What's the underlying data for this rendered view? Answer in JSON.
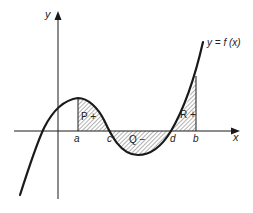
{
  "diagram": {
    "axes": {
      "x_label": "x",
      "y_label": "y"
    },
    "curve_label": "y = f (x)",
    "points": {
      "a": "a",
      "b": "b",
      "c": "c",
      "d": "d"
    },
    "regions": [
      {
        "id": "P",
        "label": "P +",
        "sign": "positive",
        "from": "a",
        "to": "c"
      },
      {
        "id": "Q",
        "label": "Q −",
        "sign": "negative",
        "from": "c",
        "to": "d"
      },
      {
        "id": "R",
        "label": "R +",
        "sign": "positive",
        "from": "d",
        "to": "b"
      }
    ],
    "colors": {
      "line": "#1a1a1a",
      "hatch": "#555555",
      "background": "#ffffff"
    }
  }
}
